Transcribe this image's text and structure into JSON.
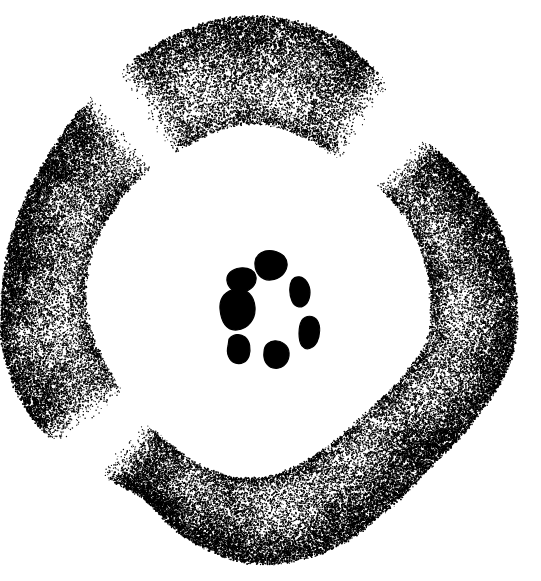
{
  "figure": {
    "background_color": "#ffffff",
    "ink_color": "#000000",
    "width": 541,
    "height": 581,
    "technique": "stipple"
  },
  "cortex_ring": {
    "name": "stippled-cortex-ring",
    "center": [
      258,
      292
    ],
    "style": {
      "dot_color": "#000000",
      "dot_min_radius": 0.45,
      "dot_max_radius": 1.05,
      "edge_density": 1.0,
      "inner_density": 0.18,
      "total_dots": 62000
    },
    "arms": [
      {
        "name": "upper-left-arm",
        "start_angle_deg": 188,
        "end_angle_deg": 312,
        "taper_start": 0.22,
        "taper_end": 0.1
      },
      {
        "name": "right-arm",
        "start_angle_deg": 322,
        "end_angle_deg": 452,
        "taper_start": 0.12,
        "taper_end": 0.12
      },
      {
        "name": "bottom-arm",
        "start_angle_deg": 58,
        "end_angle_deg": 122,
        "taper_start": 0.1,
        "taper_end": 0.16
      }
    ],
    "gaps": [
      {
        "name": "upper-right-gap",
        "angle_deg": 317,
        "width_deg": 10
      },
      {
        "name": "lower-left-gap",
        "angle_deg": 130,
        "width_deg": 14
      },
      {
        "name": "lower-right-gap",
        "angle_deg": 54,
        "width_deg": 6
      }
    ],
    "outline_radius_control_points": [
      {
        "angle_deg": 0,
        "r_outer": 258,
        "r_inner": 172
      },
      {
        "angle_deg": 15,
        "r_outer": 262,
        "r_inner": 176
      },
      {
        "angle_deg": 30,
        "r_outer": 252,
        "r_inner": 168
      },
      {
        "angle_deg": 45,
        "r_outer": 246,
        "r_inner": 162
      },
      {
        "angle_deg": 60,
        "r_outer": 254,
        "r_inner": 166
      },
      {
        "angle_deg": 75,
        "r_outer": 268,
        "r_inner": 176
      },
      {
        "angle_deg": 90,
        "r_outer": 272,
        "r_inner": 186
      },
      {
        "angle_deg": 105,
        "r_outer": 258,
        "r_inner": 184
      },
      {
        "angle_deg": 120,
        "r_outer": 236,
        "r_inner": 176
      },
      {
        "angle_deg": 135,
        "r_outer": 246,
        "r_inner": 170
      },
      {
        "angle_deg": 150,
        "r_outer": 258,
        "r_inner": 168
      },
      {
        "angle_deg": 165,
        "r_outer": 262,
        "r_inner": 170
      },
      {
        "angle_deg": 180,
        "r_outer": 256,
        "r_inner": 172
      },
      {
        "angle_deg": 195,
        "r_outer": 252,
        "r_inner": 170
      },
      {
        "angle_deg": 210,
        "r_outer": 250,
        "r_inner": 166
      },
      {
        "angle_deg": 225,
        "r_outer": 254,
        "r_inner": 164
      },
      {
        "angle_deg": 240,
        "r_outer": 262,
        "r_inner": 162
      },
      {
        "angle_deg": 255,
        "r_outer": 272,
        "r_inner": 166
      },
      {
        "angle_deg": 270,
        "r_outer": 276,
        "r_inner": 168
      },
      {
        "angle_deg": 285,
        "r_outer": 268,
        "r_inner": 162
      },
      {
        "angle_deg": 300,
        "r_outer": 248,
        "r_inner": 156
      },
      {
        "angle_deg": 315,
        "r_outer": 226,
        "r_inner": 158
      },
      {
        "angle_deg": 330,
        "r_outer": 236,
        "r_inner": 164
      },
      {
        "angle_deg": 345,
        "r_outer": 250,
        "r_inner": 168
      }
    ],
    "transverse_bands": [
      {
        "angle_deg": 12,
        "strength": 0.55
      },
      {
        "angle_deg": 36,
        "strength": 0.6
      },
      {
        "angle_deg": 62,
        "strength": 0.5
      },
      {
        "angle_deg": 86,
        "strength": 0.55
      },
      {
        "angle_deg": 108,
        "strength": 0.45
      },
      {
        "angle_deg": 146,
        "strength": 0.5
      },
      {
        "angle_deg": 172,
        "strength": 0.55
      },
      {
        "angle_deg": 198,
        "strength": 0.5
      },
      {
        "angle_deg": 224,
        "strength": 0.6
      },
      {
        "angle_deg": 250,
        "strength": 0.55
      },
      {
        "angle_deg": 276,
        "strength": 0.5
      },
      {
        "angle_deg": 300,
        "strength": 0.45
      },
      {
        "angle_deg": 336,
        "strength": 0.5
      }
    ]
  },
  "central_cluster": {
    "name": "central-bundle-ring",
    "count": 7,
    "center": [
      263,
      308
    ],
    "fill_color": "#000000",
    "bundles": [
      {
        "name": "bundle-north",
        "label": "1",
        "center": [
          268,
          268
        ],
        "path": "M255,262 C256,254 264,249 274,251 C283,253 288,259 287,266 C286,273 280,279 271,280 C262,281 254,273 255,262 Z"
      },
      {
        "name": "bundle-northwest",
        "label": "2",
        "center": [
          240,
          281
        ],
        "path": "M227,281 C226,274 232,269 240,268 C249,267 255,271 256,277 C257,284 251,291 242,292 C234,293 228,288 227,281 Z"
      },
      {
        "name": "bundle-west",
        "label": "3",
        "center": [
          235,
          310
        ],
        "path": "M220,309 C219,298 226,290 236,289 C247,288 254,296 255,307 C256,319 248,329 237,330 C226,331 221,321 220,309 Z"
      },
      {
        "name": "bundle-southwest",
        "label": "4",
        "center": [
          239,
          348
        ],
        "path": "M229,339 C233,334 240,333 245,337 C250,341 251,349 249,356 C247,362 241,365 235,363 C229,361 226,353 228,346 Z"
      },
      {
        "name": "bundle-south",
        "label": "5",
        "center": [
          275,
          355
        ],
        "path": "M264,352 C264,345 270,340 277,341 C285,342 290,348 289,356 C288,364 281,370 273,368 C266,366 263,359 264,352 Z"
      },
      {
        "name": "bundle-southeast",
        "label": "6",
        "center": [
          310,
          330
        ],
        "path": "M302,320 C306,315 313,315 317,320 C321,326 320,335 317,342 C313,349 306,351 302,346 C298,340 298,327 302,320 Z"
      },
      {
        "name": "bundle-northeast",
        "label": "7",
        "center": [
          300,
          288
        ],
        "path": "M292,280 C296,275 303,276 307,282 C311,288 311,297 307,303 C302,309 295,308 292,301 C289,294 289,285 292,280 Z"
      }
    ]
  },
  "annotations": {
    "labels_visible": false,
    "scale_bar_visible": false,
    "caption_text": ""
  }
}
